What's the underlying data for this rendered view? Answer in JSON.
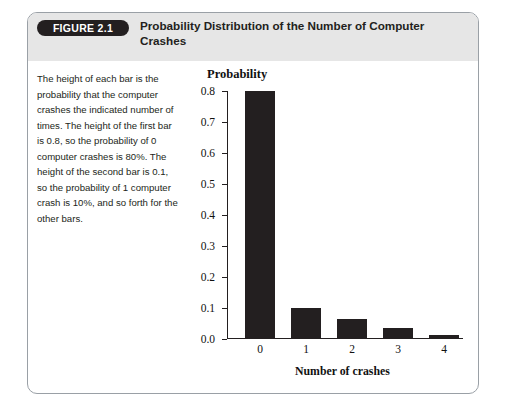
{
  "figure": {
    "badge": "FIGURE 2.1",
    "title": "Probability Distribution of the Number of Computer Crashes",
    "caption": "The height of each bar is the probability that the computer crashes the indicated number of times. The height of the first bar is 0.8, so the probability of 0 computer crashes is 80%. The height of the second bar is 0.1, so the probability of 1 computer crash is 10%, and so forth for the other bars."
  },
  "colors": {
    "bar": "#231f20",
    "badge_background": "#231f20",
    "badge_text": "#ffffff",
    "header_background": "#e6e6e6",
    "card_border": "#9aa0a6",
    "axis": "#231f20"
  },
  "chart_data": {
    "type": "bar",
    "title": "Probability Distribution of the Number of Computer Crashes",
    "xlabel": "Number of crashes",
    "ylabel": "Probability",
    "categories": [
      "0",
      "1",
      "2",
      "3",
      "4"
    ],
    "values": [
      0.8,
      0.1,
      0.065,
      0.035,
      0.012
    ],
    "ylim": [
      0.0,
      0.8
    ],
    "yticks": [
      "0.0",
      "0.1",
      "0.2",
      "0.3",
      "0.4",
      "0.5",
      "0.6",
      "0.7",
      "0.8"
    ],
    "ytick_values": [
      0.0,
      0.1,
      0.2,
      0.3,
      0.4,
      0.5,
      0.6,
      0.7,
      0.8
    ],
    "grid": false,
    "legend": false
  }
}
